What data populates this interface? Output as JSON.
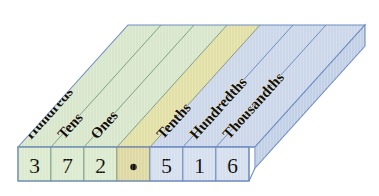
{
  "figure": {
    "type": "place-value-chart",
    "number_shown": "372.516",
    "decimal_point_symbol": "•"
  },
  "colors": {
    "whole_panel_fill": "#d8e7cb",
    "decimal_panel_fill": "#e2e0a6",
    "decimal_panel_fill_alt": "#dcdca0",
    "fraction_panel_fill": "#ccd7e9",
    "whole_cell_fill": "#dcead0",
    "decimal_cell_fill": "#ded9a2",
    "fraction_cell_fill": "#d6dfee",
    "whole_stroke": "#7fa08b",
    "fraction_stroke": "#6f8cc2",
    "side_face_fill": "#c3d1e6",
    "background": "#ffffff",
    "digit_color": "#15120c",
    "label_color": "#121008"
  },
  "columns": [
    {
      "id": "hundreds",
      "label": "Hundreds",
      "digit": "3",
      "group": "whole"
    },
    {
      "id": "tens",
      "label": "Tens",
      "digit": "7",
      "group": "whole"
    },
    {
      "id": "ones",
      "label": "Ones",
      "digit": "2",
      "group": "whole"
    },
    {
      "id": "decimal",
      "label": "",
      "digit": "•",
      "group": "decimal"
    },
    {
      "id": "tenths",
      "label": "Tenths",
      "digit": "5",
      "group": "fraction"
    },
    {
      "id": "hundredths",
      "label": "Hundredths",
      "digit": "1",
      "group": "fraction"
    },
    {
      "id": "thousandths",
      "label": "Thousandths",
      "digit": "6",
      "group": "fraction"
    }
  ]
}
